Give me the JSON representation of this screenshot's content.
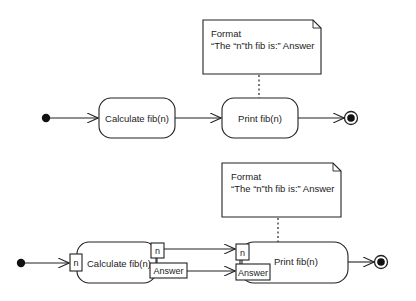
{
  "diagrams": [
    {
      "name": "simple-activity",
      "note": {
        "line1": "Format",
        "line2": "“The “n”th fib is:” Answer"
      },
      "actions": [
        {
          "label": "Calculate fib(n)"
        },
        {
          "label": "Print fib(n)"
        }
      ]
    },
    {
      "name": "activity-with-pins",
      "note": {
        "line1": "Format",
        "line2": "“The “n”th fib is:” Answer"
      },
      "actions": [
        {
          "label": "Calculate fib(n)",
          "input_pins": [
            "n"
          ],
          "output_pins": [
            "n",
            "Answer"
          ]
        },
        {
          "label": "Print fib(n)",
          "input_pins": [
            "n",
            "Answer"
          ]
        }
      ]
    }
  ],
  "colors": {
    "stroke": "#222222",
    "background": "#ffffff"
  }
}
